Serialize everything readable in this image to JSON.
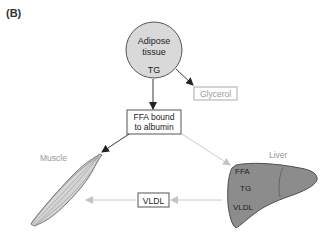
{
  "panel_label": "(B)",
  "nodes": {
    "adipose": {
      "line1": "Adipose",
      "line2": "tissue",
      "sub": "TG"
    },
    "glycerol": {
      "label": "Glycerol"
    },
    "ffa": {
      "line1": "FFA bound",
      "line2": "to albumin"
    },
    "muscle": {
      "label": "Muscle"
    },
    "liver": {
      "label": "Liver",
      "contents": [
        "FFA",
        "TG",
        "VLDL"
      ]
    },
    "vldl": {
      "label": "VLDL"
    }
  },
  "edges": [
    {
      "from": "adipose",
      "to": "glycerol"
    },
    {
      "from": "adipose",
      "to": "ffa"
    },
    {
      "from": "ffa",
      "to": "muscle"
    },
    {
      "from": "ffa",
      "to": "liver"
    },
    {
      "from": "liver",
      "to": "vldl"
    },
    {
      "from": "vldl",
      "to": "muscle"
    }
  ],
  "colors": {
    "adipose_fill": "#d9d9d9",
    "liver_fill": "#8c8c8c",
    "dark_arrow": "#222222",
    "light_arrow": "#bbbbbb",
    "grey_text": "#999999"
  }
}
